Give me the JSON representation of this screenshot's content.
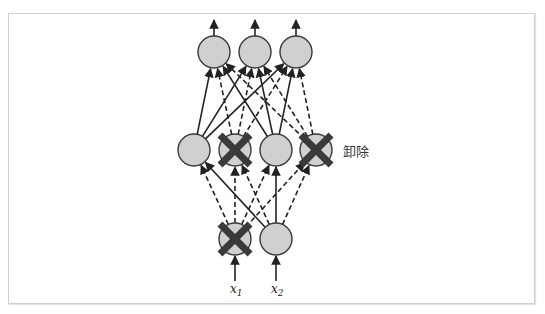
{
  "diagram": {
    "type": "dropout-neural-network",
    "dropped_label": "卸除",
    "inputs": [
      {
        "id": "x1",
        "label": "x",
        "subscript": "1",
        "dropped": true,
        "cx": 235,
        "cy": 239
      },
      {
        "id": "x2",
        "label": "x",
        "subscript": "2",
        "dropped": false,
        "cx": 276,
        "cy": 239
      }
    ],
    "hidden": [
      {
        "id": "h1",
        "dropped": false,
        "cx": 194,
        "cy": 150
      },
      {
        "id": "h2",
        "dropped": true,
        "cx": 235,
        "cy": 150
      },
      {
        "id": "h3",
        "dropped": false,
        "cx": 276,
        "cy": 150
      },
      {
        "id": "h4",
        "dropped": true,
        "cx": 316,
        "cy": 150
      }
    ],
    "outputs": [
      {
        "id": "o1",
        "cx": 214,
        "cy": 52
      },
      {
        "id": "o2",
        "cx": 255,
        "cy": 52
      },
      {
        "id": "o3",
        "cx": 296,
        "cy": 52
      }
    ],
    "legend": {
      "solid": "active connection",
      "dashed": "dropped connection"
    },
    "colors": {
      "node_fill": "#d0d0d0",
      "node_stroke": "#3a3a3a",
      "cross": "#3a3a3a",
      "edge": "#222222"
    }
  }
}
